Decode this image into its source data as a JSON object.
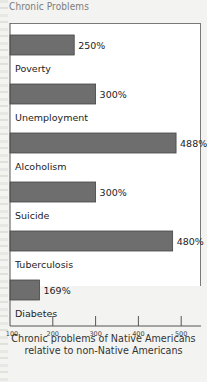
{
  "title": "Chronic Problems",
  "chart_data": {
    "type": "bar",
    "orientation": "horizontal",
    "categories": [
      "Poverty",
      "Unemployment",
      "Alcoholism",
      "Suicide",
      "Tuberculosis",
      "Diabetes"
    ],
    "values": [
      250,
      300,
      488,
      300,
      480,
      169
    ],
    "value_labels": [
      "250%",
      "300%",
      "488%",
      "300%",
      "480%",
      "169%"
    ],
    "xlim": [
      100,
      520
    ],
    "xticks": [
      100,
      200,
      300,
      400,
      500
    ],
    "xtick_labels": [
      "100",
      "200",
      "300",
      "400",
      "500"
    ],
    "xlabel": "Chronic problems of Native Americans relative to non-Native Americans",
    "caption_lines": [
      "Chronic problems of Native Americans",
      "relative to non-Native Americans"
    ],
    "bar_color": "#6e6e6e",
    "grid": false,
    "legend": "none"
  }
}
